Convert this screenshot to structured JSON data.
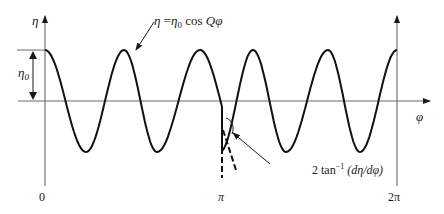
{
  "figure": {
    "y_axis_label": "η",
    "x_axis_label": "φ",
    "amplitude_label": "η",
    "amplitude_subscript": "0",
    "curve_equation": {
      "lhs": "η",
      "eq": " =",
      "amp": "η",
      "amp_sub": "0",
      "rhs": " cos ",
      "arg": "Qφ"
    },
    "angle_annotation": {
      "prefix": "2 tan",
      "superscript": "−1",
      "arg": " (dη/dφ)"
    },
    "x_ticks": [
      {
        "label": "0",
        "x": 43
      },
      {
        "label": "π",
        "x": 222
      },
      {
        "label": "2π",
        "x": 397
      }
    ]
  },
  "chart_data": {
    "type": "line",
    "title": "",
    "xlabel": "φ",
    "ylabel": "η",
    "x_tick_labels": [
      "0",
      "π",
      "2π"
    ],
    "xlim": [
      0,
      6.2832
    ],
    "ylim": [
      -1.0,
      1.0
    ],
    "series": [
      {
        "name": "η = η0 cos Qφ",
        "description": "Cosine wave of amplitude η0 with a cusp (kink) at φ = π; dashed tangents at the cusp mark the angle 2 tan^-1(dη/dφ)",
        "points": [
          [
            0.0,
            1.0
          ],
          [
            0.63,
            0.0
          ],
          [
            1.25,
            -1.0
          ],
          [
            1.93,
            0.0
          ],
          [
            2.58,
            1.0
          ],
          [
            2.97,
            0.0
          ],
          [
            3.1416,
            -0.55
          ],
          [
            3.5,
            0.0
          ],
          [
            4.2,
            1.0
          ],
          [
            4.8,
            0.0
          ],
          [
            5.2,
            -1.0
          ],
          [
            5.8,
            0.0
          ],
          [
            6.2832,
            1.0
          ]
        ]
      }
    ],
    "annotations": [
      "η = η0 cos Qφ",
      "2 tan^-1 (dη/dφ)",
      "η0"
    ],
    "grid": false,
    "legend": "none"
  },
  "geometry": {
    "axis_y_px": 101,
    "peak_y_px": 50,
    "trough_y_px": 150,
    "cusp": {
      "x": 222,
      "y": 128
    },
    "left_axis_x": 45,
    "right_axis_x": 397,
    "left_peaks": [
      45,
      124,
      200
    ],
    "left_troughs": [
      86,
      157
    ],
    "right_peaks": [
      253,
      328,
      397
    ],
    "right_troughs": [
      286,
      360
    ]
  }
}
